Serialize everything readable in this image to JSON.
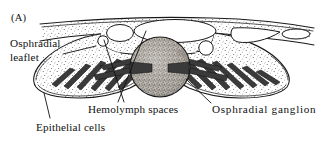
{
  "figure": {
    "panel_label": "(A)",
    "kind": "line-drawing",
    "background_color": "#ffffff",
    "ink_color": "#111111"
  },
  "labels": {
    "osphradial_leaflet_line1": "Osphradial",
    "osphradial_leaflet_line2": "leaflet",
    "epithelial_cells": "Epithelial cells",
    "hemolymph_spaces": "Hemolymph spaces",
    "osphradial_ganglion": "Osphradial  ganglion"
  },
  "structures": {
    "ganglion_fill": "#a8a29b",
    "tissue_fill": "#ffffff",
    "stipple_color": "#555555",
    "ridge_fill": "#3a3a3a",
    "cavity_fill": "#ffffff",
    "cavity_count": 6,
    "left_leaflet_ridges": 6,
    "right_leaflet_ridges": 7
  }
}
